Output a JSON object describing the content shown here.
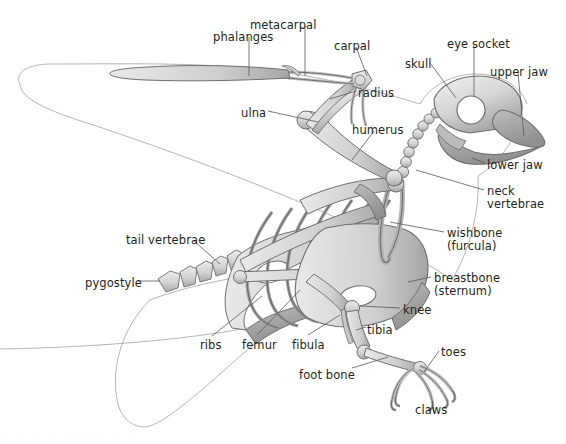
{
  "figure": {
    "background_color": "#ffffff",
    "bone_fill_light": "#e3e3e3",
    "bone_fill_mid": "#c7c7c7",
    "bone_fill_dark": "#a9a9a9",
    "bone_stroke": "#6e6e6e",
    "body_outline_color": "#b5b5b5",
    "leader_line_color": "#58585a",
    "label_text_color": "#231f20"
  },
  "labels": [
    {
      "id": "phalanges",
      "text": "phalanges",
      "x": 213,
      "y": 31,
      "align": "left"
    },
    {
      "id": "metacarpal",
      "text": "metacarpal",
      "x": 250,
      "y": 19,
      "align": "left"
    },
    {
      "id": "carpal",
      "text": "carpal",
      "x": 334,
      "y": 40,
      "align": "left"
    },
    {
      "id": "skull",
      "text": "skull",
      "x": 405,
      "y": 58,
      "align": "left"
    },
    {
      "id": "eye-socket",
      "text": "eye socket",
      "x": 447,
      "y": 38,
      "align": "left"
    },
    {
      "id": "upper-jaw",
      "text": "upper jaw",
      "x": 490,
      "y": 66,
      "align": "left"
    },
    {
      "id": "radius",
      "text": "radius",
      "x": 358,
      "y": 87,
      "align": "left"
    },
    {
      "id": "ulna",
      "text": "ulna",
      "x": 241,
      "y": 107,
      "align": "left"
    },
    {
      "id": "humerus",
      "text": "humerus",
      "x": 352,
      "y": 124,
      "align": "left"
    },
    {
      "id": "lower-jaw",
      "text": "lower jaw",
      "x": 487,
      "y": 159,
      "align": "left"
    },
    {
      "id": "neck-vertebrae",
      "text": "neck\nvertebrae",
      "x": 487,
      "y": 185,
      "align": "left"
    },
    {
      "id": "wishbone",
      "text": "wishbone\n(furcula)",
      "x": 447,
      "y": 227,
      "align": "left"
    },
    {
      "id": "tail-vertebrae",
      "text": "tail vertebrae",
      "x": 126,
      "y": 234,
      "align": "left"
    },
    {
      "id": "breastbone",
      "text": "breastbone\n(sternum)",
      "x": 434,
      "y": 272,
      "align": "left"
    },
    {
      "id": "pygostyle",
      "text": "pygostyle",
      "x": 85,
      "y": 277,
      "align": "left"
    },
    {
      "id": "knee",
      "text": "knee",
      "x": 403,
      "y": 304,
      "align": "left"
    },
    {
      "id": "tibia",
      "text": "tibia",
      "x": 367,
      "y": 324,
      "align": "left"
    },
    {
      "id": "ribs",
      "text": "ribs",
      "x": 200,
      "y": 339,
      "align": "left"
    },
    {
      "id": "femur",
      "text": "femur",
      "x": 242,
      "y": 339,
      "align": "left"
    },
    {
      "id": "fibula",
      "text": "fibula",
      "x": 292,
      "y": 339,
      "align": "left"
    },
    {
      "id": "toes",
      "text": "toes",
      "x": 441,
      "y": 346,
      "align": "left"
    },
    {
      "id": "foot-bone",
      "text": "foot bone",
      "x": 299,
      "y": 369,
      "align": "left"
    },
    {
      "id": "claws",
      "text": "claws",
      "x": 415,
      "y": 404,
      "align": "left"
    }
  ],
  "bottom_edge_artifact": ". .  .   .  ..  .    .   .   ."
}
